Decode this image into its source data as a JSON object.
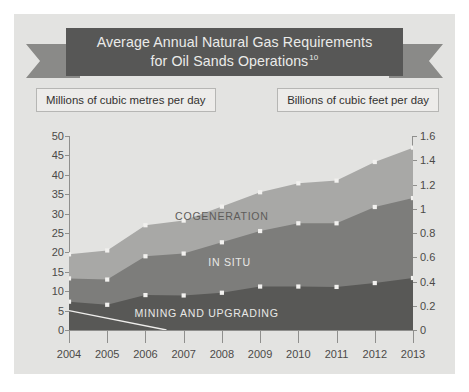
{
  "banner": {
    "title_line1": "Average Annual Natural Gas Requirements",
    "title_line2": "for Oil Sands Operations",
    "footnote_marker": "10"
  },
  "units": {
    "left_label": "Millions of cubic metres per day",
    "right_label": "Billions of cubic feet per day"
  },
  "colors": {
    "figure_background": "#e3e3e1",
    "banner_plate": "#575756",
    "banner_tail": "#8a8a88",
    "mining_and_upgrading": "#585856",
    "in_situ": "#7d7d7b",
    "cogeneration": "#a8a8a6",
    "marker": "#f2f1ef",
    "axis": "#8f8f8d",
    "trend_line": "#efeeec"
  },
  "chart_data": {
    "type": "area",
    "title": "Average Annual Natural Gas Requirements for Oil Sands Operations",
    "xlabel": "",
    "ylabel": "Millions of cubic metres per day",
    "ylabel_secondary": "Billions of cubic feet per day",
    "grid": false,
    "legend_position": "inline-layer-labels",
    "stacked": true,
    "categories": [
      "2004",
      "2005",
      "2006",
      "2007",
      "2008",
      "2009",
      "2010",
      "2011",
      "2012",
      "2013"
    ],
    "ylim": [
      0,
      50
    ],
    "yticks": [
      0,
      5,
      10,
      15,
      20,
      25,
      30,
      35,
      40,
      45,
      50
    ],
    "ylim_secondary": [
      0,
      1.6
    ],
    "yticks_secondary": [
      "0",
      "0.2",
      "0.4",
      "0.6",
      "0.8",
      "1",
      "1.2",
      "1.4",
      "1.6"
    ],
    "series": [
      {
        "name": "MINING AND UPGRADING",
        "color": "#585856",
        "values": [
          7.3,
          6.5,
          9.0,
          8.9,
          9.6,
          11.2,
          11.2,
          11.1,
          12.1,
          13.4
        ]
      },
      {
        "name": "IN SITU",
        "color": "#7d7d7b",
        "values": [
          6.0,
          6.5,
          10.0,
          10.8,
          13.0,
          14.3,
          16.3,
          16.4,
          19.6,
          20.6
        ]
      },
      {
        "name": "COGENERATION",
        "color": "#a8a8a6",
        "values": [
          6.2,
          7.5,
          8.0,
          8.5,
          9.2,
          10.0,
          10.3,
          11.0,
          11.6,
          13.0
        ]
      }
    ],
    "cumulative_totals": {
      "mining_and_upgrading": [
        7.3,
        6.5,
        9.0,
        8.9,
        9.6,
        11.2,
        11.2,
        11.1,
        12.1,
        13.4
      ],
      "through_in_situ": [
        13.3,
        13.0,
        19.0,
        19.7,
        22.6,
        25.5,
        27.5,
        27.5,
        31.7,
        34.0
      ],
      "through_cogeneration": [
        19.5,
        20.5,
        27.0,
        28.2,
        31.8,
        35.5,
        37.8,
        38.5,
        43.3,
        47.0
      ]
    },
    "annotations": [
      {
        "text": "COGENERATION",
        "x": 2008,
        "y": 29.5
      },
      {
        "text": "IN SITU",
        "x": 2008.2,
        "y": 17.5
      },
      {
        "text": "MINING AND UPGRADING",
        "x": 2007.6,
        "y": 4.5
      }
    ],
    "trend_line": {
      "description": "thin light descending line",
      "points": [
        {
          "x": 2004,
          "y": 5.0
        },
        {
          "x": 2006.55,
          "y": 0.0
        }
      ]
    }
  }
}
